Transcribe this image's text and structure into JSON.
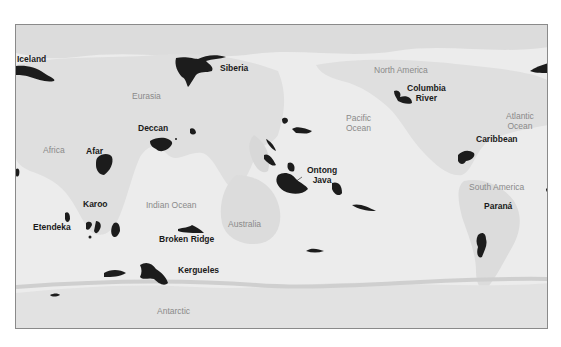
{
  "map": {
    "type": "world map (Pacific-centred), large igneous provinces",
    "colors": {
      "province_fill": "#1c1c1c",
      "land": "#dedede",
      "ocean": "#ececec",
      "ice": "#e2e2e2",
      "frame": "#8a8a8a",
      "geo_label": "#8a8a8a",
      "province_label": "#1a1a1a"
    },
    "geographic_labels": [
      {
        "id": "eurasia",
        "text": "Eurasia"
      },
      {
        "id": "africa",
        "text": "Africa"
      },
      {
        "id": "indian-ocean",
        "text": "Indian Ocean"
      },
      {
        "id": "australia",
        "text": "Australia"
      },
      {
        "id": "antarctic",
        "text": "Antarctic"
      },
      {
        "id": "north-america",
        "text": "North America"
      },
      {
        "id": "pacific-ocean",
        "line1": "Pacific",
        "line2": "Ocean"
      },
      {
        "id": "atlantic-ocean",
        "line1": "Atlantic",
        "line2": "Ocean"
      },
      {
        "id": "south-america",
        "text": "South America"
      }
    ],
    "provinces": [
      {
        "id": "iceland",
        "text": "Iceland"
      },
      {
        "id": "siberia",
        "text": "Siberia"
      },
      {
        "id": "deccan",
        "text": "Deccan"
      },
      {
        "id": "afar",
        "text": "Afar"
      },
      {
        "id": "karoo",
        "text": "Karoo"
      },
      {
        "id": "etendeka",
        "text": "Etendeka"
      },
      {
        "id": "broken-ridge",
        "text": "Broken Ridge"
      },
      {
        "id": "kergueles",
        "text": "Kergueles"
      },
      {
        "id": "ontong-java",
        "line1": "Ontong",
        "line2": "Java"
      },
      {
        "id": "columbia-river",
        "line1": "Columbia",
        "line2": "River"
      },
      {
        "id": "caribbean",
        "text": "Caribbean"
      },
      {
        "id": "parana",
        "text": "Paraná"
      }
    ]
  }
}
